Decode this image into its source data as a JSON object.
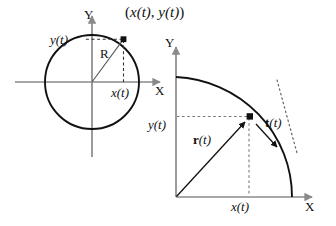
{
  "figure": {
    "colors": {
      "axis": "#8a8a8a",
      "curve": "#111111",
      "dashed": "#555555",
      "dotted": "#666666",
      "point": "#111111",
      "background": "#ffffff"
    },
    "panels": [
      {
        "id": "left-panel",
        "name": "full-circle-diagram",
        "axis_x_label": "X",
        "axis_y_label": "Y",
        "point_label": "(x(t), y(t))",
        "radius_label": "R",
        "x_projection_label": "x(t)",
        "y_projection_label": "y(t)",
        "geometry": {
          "center": [
            92,
            82
          ],
          "radius": 47,
          "point": [
            124,
            39
          ],
          "x_axis_span": [
            15,
            165
          ],
          "y_axis_span": [
            155,
            10
          ]
        }
      },
      {
        "id": "right-panel",
        "name": "quarter-arc-diagram",
        "axis_x_label": "X",
        "axis_y_label": "Y",
        "position_vector_label": "r(t)",
        "tangent_vector_label": "t(t)",
        "x_projection_label": "x(t)",
        "y_projection_label": "y(t)",
        "geometry": {
          "origin": [
            176,
            197
          ],
          "radius": 125,
          "point": [
            250,
            116
          ],
          "x_axis_span": [
            176,
            316
          ],
          "y_axis_span": [
            197,
            45
          ]
        }
      }
    ]
  },
  "labels": {
    "left": {
      "axis_x": "X",
      "axis_y": "Y",
      "point": "(x(t), y(t))",
      "point_open_paren": "(",
      "point_x": "x(t)",
      "point_comma": ", ",
      "point_y": "y(t)",
      "point_close_paren": ")",
      "radius": "R",
      "x_proj": "x(t)",
      "y_proj": "y(t)"
    },
    "right": {
      "axis_x": "X",
      "axis_y": "Y",
      "r_vector_bold": "r",
      "r_vector_arg": "(t)",
      "t_vector_bold": "t",
      "t_vector_arg": "(t)",
      "x_proj": "x(t)",
      "y_proj": "y(t)"
    }
  }
}
